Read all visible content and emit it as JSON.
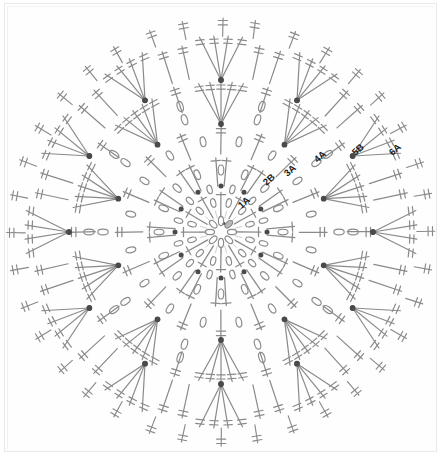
{
  "document": {
    "type": "crochet-stitch-chart",
    "title": "Round crochet motif stitch diagram",
    "background_color": "#ffffff",
    "ink_color": "#8a8a8a",
    "node_color": "#4a4a4a",
    "label_color": "#1a1a1a",
    "canvas": {
      "width": 442,
      "height": 460
    }
  },
  "chart_data": {
    "type": "diagram",
    "shape": "circular-mandala",
    "center": {
      "x": 221,
      "y": 232
    },
    "symbol_legend": [
      {
        "name": "chain",
        "glyph": "oval",
        "description": "chain stitch shown as small open oval"
      },
      {
        "name": "slip-stitch",
        "glyph": "filled-dot",
        "description": "join point shown as filled dot"
      },
      {
        "name": "double-crochet",
        "glyph": "single-bar-stem",
        "description": "stem with one crossbar"
      },
      {
        "name": "treble-crochet",
        "glyph": "double-bar-stem",
        "description": "stem with two crossbars"
      },
      {
        "name": "fan-cluster",
        "glyph": "converging-rays",
        "description": "multiple stems converging to one dot"
      }
    ],
    "rounds": [
      {
        "label": "1A",
        "index": 1,
        "radius": 28,
        "variant": "A",
        "symbol": "chain",
        "count": 8
      },
      {
        "label": "2B",
        "index": 2,
        "radius": 56,
        "variant": "B",
        "symbol": "chain",
        "count": 12
      },
      {
        "label": "3A",
        "index": 3,
        "radius": 84,
        "variant": "A",
        "symbol": "fan-cluster",
        "count": 12
      },
      {
        "label": "4A",
        "index": 4,
        "radius": 112,
        "variant": "A",
        "symbol": "chain",
        "count": 16
      },
      {
        "label": "5B",
        "index": 5,
        "radius": 140,
        "variant": "B",
        "symbol": "chain",
        "count": 20
      },
      {
        "label": "6A",
        "index": 6,
        "radius": 168,
        "variant": "A",
        "symbol": "treble-crochet",
        "count": 24
      }
    ],
    "round_labels": [
      {
        "text": "1A",
        "x": 246,
        "y": 205,
        "rotation": -42
      },
      {
        "text": "2B",
        "x": 271,
        "y": 182,
        "rotation": -42
      },
      {
        "text": "3A",
        "x": 292,
        "y": 173,
        "rotation": -42
      },
      {
        "text": "4A",
        "x": 322,
        "y": 159,
        "rotation": -42
      },
      {
        "text": "5B",
        "x": 360,
        "y": 152,
        "rotation": -42
      },
      {
        "text": "6A",
        "x": 397,
        "y": 152,
        "rotation": -42
      }
    ]
  }
}
